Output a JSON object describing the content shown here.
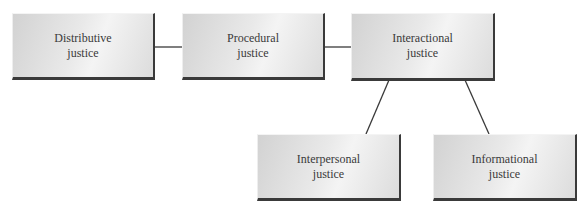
{
  "diagram": {
    "nodes": [
      {
        "id": "distributive",
        "label": "Distributive\njustice"
      },
      {
        "id": "procedural",
        "label": "Procedural\njustice"
      },
      {
        "id": "interactional",
        "label": "Interactional\njustice"
      },
      {
        "id": "interpersonal",
        "label": "Interpersonal\njustice"
      },
      {
        "id": "informational",
        "label": "Informational\njustice"
      }
    ],
    "edges": [
      {
        "from": "distributive",
        "to": "procedural"
      },
      {
        "from": "procedural",
        "to": "interactional"
      },
      {
        "from": "interactional",
        "to": "interpersonal"
      },
      {
        "from": "interactional",
        "to": "informational"
      }
    ],
    "colors": {
      "box_fill": "#e4e4e4",
      "box_shadow": "#3a3a3a",
      "line": "#3a3a3a",
      "text": "#3a3a3a"
    }
  }
}
